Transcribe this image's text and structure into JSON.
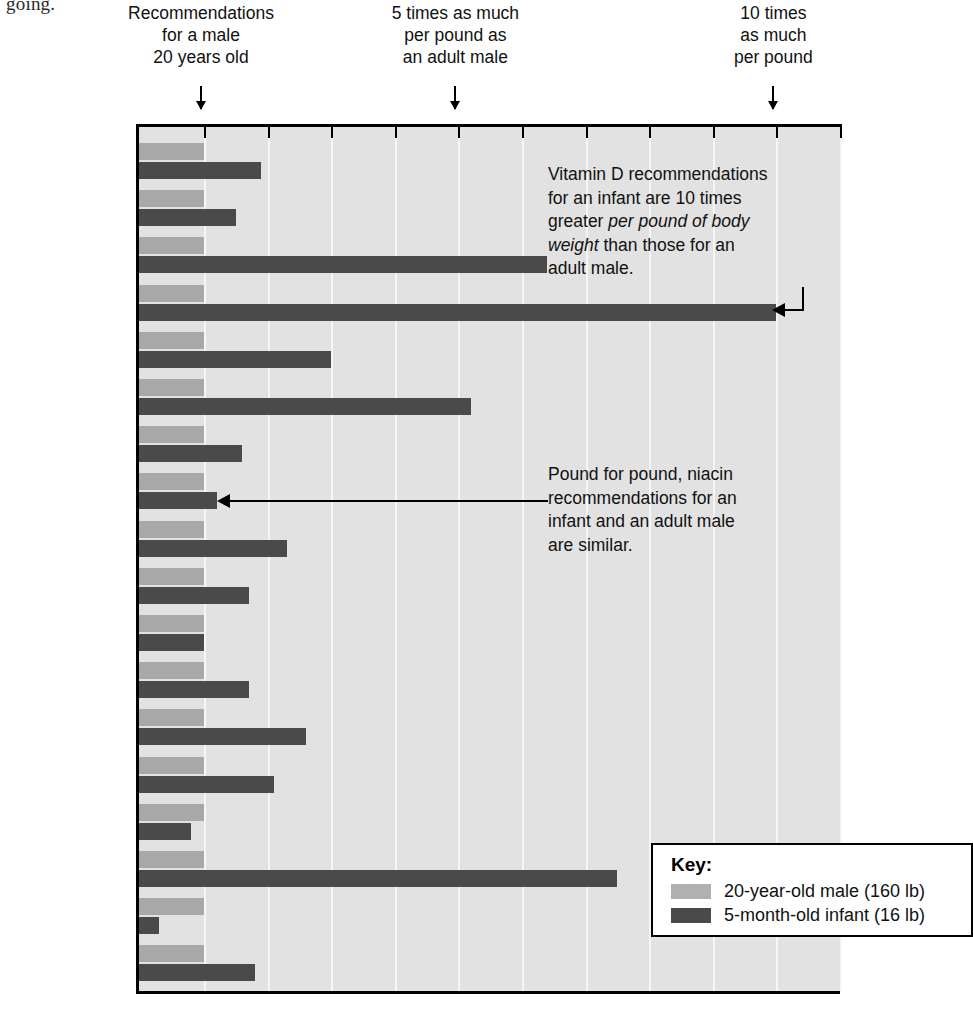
{
  "page": {
    "cut_off_text": "going."
  },
  "top_notes": [
    {
      "name": "recommendations-male-20",
      "lines": [
        "Recommendations",
        "for a male",
        "20 years old"
      ],
      "arrow_at_multiple": 1
    },
    {
      "name": "five-times-per-pound",
      "lines": [
        "5 times as much",
        "per pound as",
        "an adult male"
      ],
      "arrow_at_multiple": 5
    },
    {
      "name": "ten-times-per-pound",
      "lines": [
        "10 times",
        "as much",
        "per pound"
      ],
      "arrow_at_multiple": 10
    }
  ],
  "annotations": [
    {
      "name": "vitamin-d-note",
      "lines": [
        "Vitamin D recommendations",
        "for an infant are 10 times",
        "greater per pound of body",
        "weight than those for an",
        "adult male."
      ],
      "italic_phrase": "per pound of body weight"
    },
    {
      "name": "niacin-note",
      "lines": [
        "Pound for pound, niacin",
        "recommendations for an",
        "infant and an adult male",
        "are similar."
      ],
      "italic_phrase": ""
    }
  ],
  "key": {
    "title": "Key:",
    "items": [
      {
        "label": "20-year-old male (160 lb)",
        "color": "#b0b0b0"
      },
      {
        "label": "5-month-old infant (16 lb)",
        "color": "#4a4a4a"
      }
    ]
  },
  "chart_data": {
    "type": "bar",
    "orientation": "horizontal",
    "title": "",
    "xlabel": "",
    "ylabel": "",
    "xlim": [
      0,
      11.1
    ],
    "xticks": [
      1,
      2,
      3,
      4,
      5,
      6,
      7,
      8,
      9,
      10,
      11
    ],
    "xtick_labels": [
      "",
      "",
      "",
      "",
      "",
      "",
      "",
      "",
      "",
      "",
      ""
    ],
    "x_unit": "multiple of adult-male recommendation per pound",
    "grid": true,
    "legend_position": "inside-lower-right",
    "categories": [
      "Energy",
      "Protein",
      "Vitamin A",
      "Vitamin D",
      "Vitamin E",
      "Vitamin C",
      "Folate",
      "Niacin",
      "Riboflavin",
      "Thiamin",
      "Vitamin B6",
      "Vitamin B12",
      "Calcium",
      "Phosphorus",
      "Magnesium",
      "Iodine",
      "Iron",
      "Zinc"
    ],
    "category_labels_html": [
      "Energy",
      "Protein",
      "Vitamin A",
      "Vitamin D",
      "Vitamin E",
      "Vitamin C",
      "Folate",
      "Niacin",
      "Riboflavin",
      "Thiamin",
      "Vitamin B<sub>6</sub>",
      "Vitamin B<sub>12</sub>",
      "Calcium",
      "Phosphorus",
      "Magnesium",
      "Iodine",
      "Iron",
      "Zinc"
    ],
    "series": [
      {
        "name": "20-year-old male (160 lb)",
        "color": "#a8a8a8",
        "values": [
          1,
          1,
          1,
          1,
          1,
          1,
          1,
          1,
          1,
          1,
          1,
          1,
          1,
          1,
          1,
          1,
          1,
          1
        ]
      },
      {
        "name": "5-month-old infant (16 lb)",
        "color": "#4a4a4a",
        "values": [
          1.9,
          1.5,
          6.4,
          10.0,
          3.0,
          5.2,
          1.6,
          1.2,
          2.3,
          1.7,
          1.0,
          1.7,
          2.6,
          2.1,
          0.8,
          7.5,
          0.3,
          1.8
        ]
      }
    ]
  }
}
